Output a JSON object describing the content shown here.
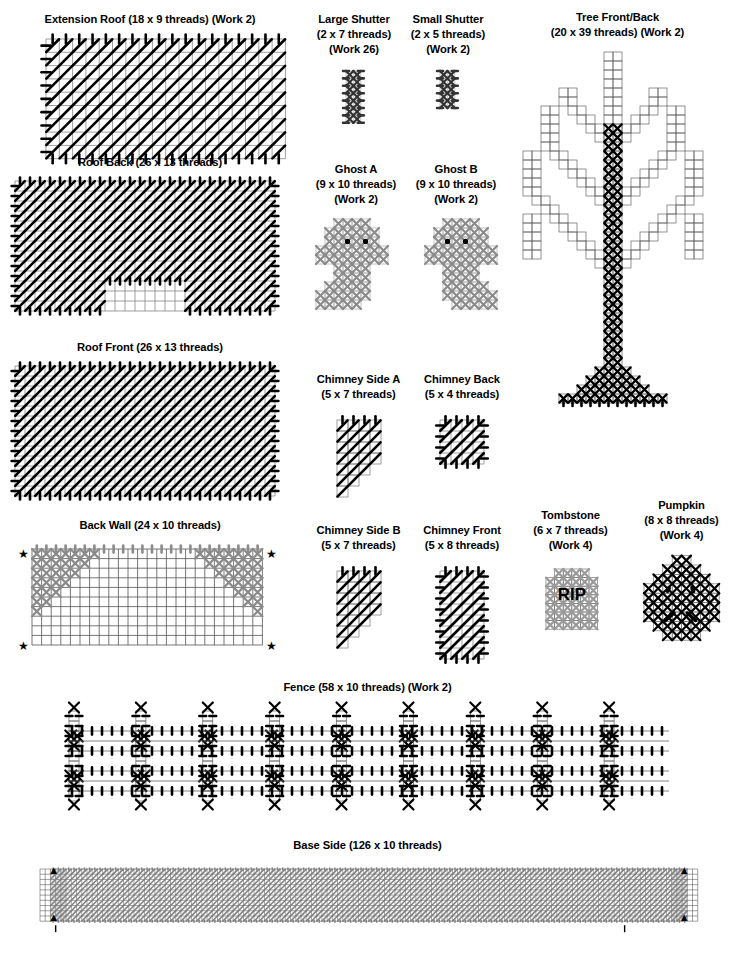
{
  "document": {
    "kind": "plastic-canvas-pattern-sheet",
    "theme": "Halloween haunted house",
    "background_color": "#ffffff",
    "ink_color": "#000000",
    "gray_stitch_color": "#808080",
    "grid_line_color": "#666666"
  },
  "panels": [
    {
      "id": "extension-roof",
      "name": "Extension Roof",
      "title_lines": [
        "Extension Roof (18 x 9 threads) (Work 2)"
      ],
      "cols": 18,
      "rows": 9,
      "work": 2,
      "stitch": "slanted-gobelin",
      "stitch_color": "#000000",
      "overcast_edges": [
        "top",
        "bottom",
        "left"
      ]
    },
    {
      "id": "roof-back",
      "name": "Roof Back",
      "title_lines": [
        "Roof Back (26 x 13 threads)"
      ],
      "cols": 26,
      "rows": 13,
      "work": 1,
      "stitch": "slanted-gobelin",
      "stitch_color": "#000000",
      "notch": {
        "start_col": 9,
        "end_col": 17,
        "rows": 3
      },
      "overcast_edges": [
        "top",
        "bottom",
        "left",
        "right"
      ]
    },
    {
      "id": "roof-front",
      "name": "Roof Front",
      "title_lines": [
        "Roof Front (26 x 13 threads)"
      ],
      "cols": 26,
      "rows": 13,
      "work": 1,
      "stitch": "slanted-gobelin",
      "stitch_color": "#000000",
      "overcast_edges": [
        "top",
        "bottom",
        "left",
        "right"
      ]
    },
    {
      "id": "back-wall",
      "name": "Back Wall",
      "title_lines": [
        "Back Wall (24 x 10 threads)"
      ],
      "cols": 24,
      "rows": 10,
      "work": 1,
      "stitch": "cross",
      "stitch_color": "#808080",
      "corner_markers": "star",
      "marker_glyph": "★"
    },
    {
      "id": "large-shutter",
      "name": "Large Shutter",
      "title_lines": [
        "Large Shutter",
        "(2 x 7 threads)",
        "(Work 26)"
      ],
      "cols": 2,
      "rows": 7,
      "work": 26,
      "stitch": "cross",
      "stitch_color": "#333333"
    },
    {
      "id": "small-shutter",
      "name": "Small Shutter",
      "title_lines": [
        "Small Shutter",
        "(2 x 5 threads)",
        "(Work 2)"
      ],
      "cols": 2,
      "rows": 5,
      "work": 2,
      "stitch": "cross",
      "stitch_color": "#333333"
    },
    {
      "id": "ghost-a",
      "name": "Ghost A",
      "title_lines": [
        "Ghost A",
        "(9 x 10 threads)",
        "(Work 2)"
      ],
      "cols": 9,
      "rows": 10,
      "work": 2,
      "stitch": "cross",
      "stitch_color": "#8a8a8a",
      "eyes": 2,
      "eye_color": "#000000",
      "tail_direction": "left"
    },
    {
      "id": "ghost-b",
      "name": "Ghost B",
      "title_lines": [
        "Ghost B",
        "(9 x 10 threads)",
        "(Work 2)"
      ],
      "cols": 9,
      "rows": 10,
      "work": 2,
      "stitch": "cross",
      "stitch_color": "#8a8a8a",
      "eyes": 2,
      "eye_color": "#000000",
      "tail_direction": "right"
    },
    {
      "id": "tree-front-back",
      "name": "Tree Front/Back",
      "title_lines": [
        "Tree Front/Back",
        "(20 x 39 threads) (Work 2)"
      ],
      "cols": 20,
      "rows": 39,
      "work": 2,
      "stitch": "outline-and-cross",
      "stitch_color": "#000000"
    },
    {
      "id": "chimney-side-a",
      "name": "Chimney Side A",
      "title_lines": [
        "Chimney Side A",
        "(5 x 7 threads)"
      ],
      "cols": 5,
      "rows": 7,
      "work": 1,
      "stitch": "slanted-gobelin",
      "stitch_color": "#000000",
      "shape": "stepped-diagonal-lower-left"
    },
    {
      "id": "chimney-back",
      "name": "Chimney Back",
      "title_lines": [
        "Chimney Back",
        "(5 x 4 threads)"
      ],
      "cols": 5,
      "rows": 4,
      "work": 1,
      "stitch": "slanted-gobelin",
      "stitch_color": "#000000"
    },
    {
      "id": "chimney-side-b",
      "name": "Chimney Side B",
      "title_lines": [
        "Chimney Side B",
        "(5 x 7 threads)"
      ],
      "cols": 5,
      "rows": 7,
      "work": 1,
      "stitch": "slanted-gobelin",
      "stitch_color": "#000000",
      "shape": "stepped-diagonal-lower-right"
    },
    {
      "id": "chimney-front",
      "name": "Chimney Front",
      "title_lines": [
        "Chimney Front",
        "(5 x 8 threads)"
      ],
      "cols": 5,
      "rows": 8,
      "work": 1,
      "stitch": "slanted-gobelin",
      "stitch_color": "#000000"
    },
    {
      "id": "tombstone",
      "name": "Tombstone",
      "title_lines": [
        "Tombstone",
        "(6 x 7 threads)",
        "(Work 4)"
      ],
      "cols": 6,
      "rows": 7,
      "work": 4,
      "stitch": "cross",
      "stitch_color": "#9a9a9a",
      "inscription": "RIP",
      "inscription_color": "#000000"
    },
    {
      "id": "pumpkin",
      "name": "Pumpkin",
      "title_lines": [
        "Pumpkin",
        "(8 x 8 threads)",
        "(Work 4)"
      ],
      "cols": 8,
      "rows": 8,
      "work": 4,
      "stitch": "cross",
      "stitch_color": "#000000",
      "face": {
        "eyes": 2,
        "mouth_segments": 2
      },
      "has_stem": true
    },
    {
      "id": "fence",
      "name": "Fence",
      "title_lines": [
        "Fence (58 x 10 threads) (Work 2)"
      ],
      "cols": 58,
      "rows": 10,
      "work": 2,
      "stitch": "cross-and-gobelin",
      "stitch_color": "#000000",
      "posts": 9,
      "rails": 2
    },
    {
      "id": "base-side",
      "name": "Base Side",
      "title_lines": [
        "Base Side (126 x 10 threads)"
      ],
      "cols": 126,
      "rows": 10,
      "work": 1,
      "stitch": "slanted-gobelin",
      "stitch_color": "#808080",
      "corner_markers": "triangle",
      "marker_glyph": "▲"
    }
  ]
}
